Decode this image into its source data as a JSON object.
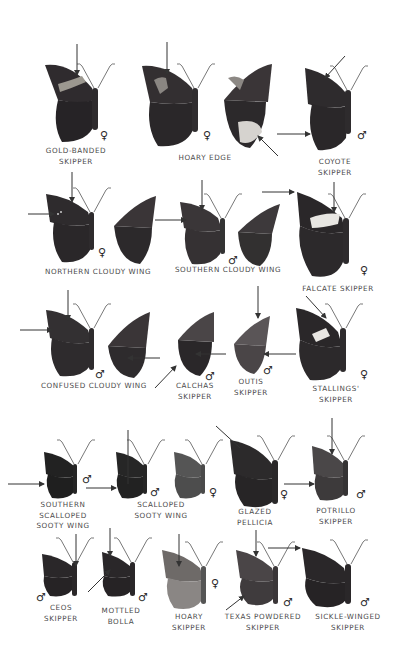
{
  "page": {
    "background": "#ffffff",
    "ink_color": "#4a4a4a",
    "arrow_color": "#333333"
  },
  "symbols": {
    "female": "♀",
    "male": "♂"
  },
  "species": [
    {
      "id": "gold-banded-skipper",
      "label": "GOLD-BANDED\nSKIPPER",
      "sex": "♀",
      "views": [
        "dorsal"
      ],
      "features": [
        "gold band on forewing"
      ]
    },
    {
      "id": "hoary-edge",
      "label": "HOARY EDGE",
      "sex": "♀",
      "views": [
        "dorsal",
        "ventral"
      ],
      "features": [
        "white hindwing margin below"
      ]
    },
    {
      "id": "coyote-skipper",
      "label": "COYOTE\nSKIPPER",
      "sex": "♂",
      "views": [
        "dorsal"
      ]
    },
    {
      "id": "northern-cloudy-wing",
      "label": "NORTHERN CLOUDY WING",
      "sex": "♀",
      "views": [
        "dorsal",
        "ventral"
      ]
    },
    {
      "id": "southern-cloudy-wing",
      "label": "SOUTHERN CLOUDY WING",
      "sex": "♂",
      "views": [
        "dorsal",
        "ventral"
      ]
    },
    {
      "id": "falcate-skipper",
      "label": "FALCATE SKIPPER",
      "sex": "♀",
      "views": [
        "dorsal"
      ]
    },
    {
      "id": "confused-cloudy-wing",
      "label": "CONFUSED CLOUDY WING",
      "sex": "♂",
      "views": [
        "dorsal",
        "ventral"
      ]
    },
    {
      "id": "calchas-skipper",
      "label": "CALCHAS\nSKIPPER",
      "sex": "♂",
      "views": [
        "ventral"
      ]
    },
    {
      "id": "outis-skipper",
      "label": "OUTIS\nSKIPPER",
      "sex": "♂",
      "views": [
        "ventral"
      ]
    },
    {
      "id": "stallings-skipper",
      "label": "STALLINGS'\nSKIPPER",
      "sex": "♀",
      "views": [
        "dorsal"
      ]
    },
    {
      "id": "southern-scalloped-sooty-wing",
      "label": "SOUTHERN\nSCALLOPED\nSOOTY WING",
      "sex": "♂",
      "views": [
        "dorsal"
      ]
    },
    {
      "id": "scalloped-sooty-wing",
      "label": "SCALLOPED\nSOOTY WING",
      "sexes": [
        "♂",
        "♀"
      ],
      "views": [
        "dorsal",
        "dorsal"
      ]
    },
    {
      "id": "glazed-pellicia",
      "label": "GLAZED\nPELLICIA",
      "sex": "♀",
      "views": [
        "dorsal"
      ]
    },
    {
      "id": "potrillo-skipper",
      "label": "POTRILLO\nSKIPPER",
      "sex": "♂",
      "views": [
        "dorsal"
      ]
    },
    {
      "id": "ceos-skipper",
      "label": "CEOS\nSKIPPER",
      "sex": "♂",
      "views": [
        "dorsal"
      ]
    },
    {
      "id": "mottled-bolla",
      "label": "MOTTLED\nBOLLA",
      "sex": "♂",
      "views": [
        "dorsal"
      ]
    },
    {
      "id": "hoary-skipper",
      "label": "HOARY\nSKIPPER",
      "sex": "♀",
      "views": [
        "dorsal"
      ]
    },
    {
      "id": "texas-powdered-skipper",
      "label": "TEXAS POWDERED\nSKIPPER",
      "sex": "♂",
      "views": [
        "dorsal"
      ]
    },
    {
      "id": "sickle-winged-skipper",
      "label": "SICKLE-WINGED\nSKIPPER",
      "sex": "♂",
      "views": [
        "dorsal"
      ]
    }
  ],
  "labels": {
    "gold_banded": "GOLD-BANDED\nSKIPPER",
    "hoary_edge": "HOARY EDGE",
    "coyote": "COYOTE\nSKIPPER",
    "northern_cloudy": "NORTHERN CLOUDY WING",
    "southern_cloudy": "SOUTHERN CLOUDY WING",
    "falcate": "FALCATE SKIPPER",
    "confused_cloudy": "CONFUSED CLOUDY WING",
    "calchas": "CALCHAS\nSKIPPER",
    "outis": "OUTIS\nSKIPPER",
    "stallings": "STALLINGS'\nSKIPPER",
    "southern_scalloped": "SOUTHERN\nSCALLOPED\nSOOTY WING",
    "scalloped": "SCALLOPED\nSOOTY WING",
    "glazed": "GLAZED\nPELLICIA",
    "potrillo": "POTRILLO\nSKIPPER",
    "ceos": "CEOS\nSKIPPER",
    "mottled": "MOTTLED\nBOLLA",
    "hoary_skipper": "HOARY\nSKIPPER",
    "texas_powdered": "TEXAS POWDERED\nSKIPPER",
    "sickle_winged": "SICKLE-WINGED\nSKIPPER"
  },
  "sex_marks": {
    "gold_banded": "♀",
    "hoary_edge": "♀",
    "coyote": "♂",
    "northern_cloudy": "♀",
    "southern_cloudy": "♂",
    "falcate": "♀",
    "confused_cloudy": "♂",
    "calchas": "♂",
    "outis": "♂",
    "stallings": "♀",
    "southern_scalloped": "♂",
    "scalloped_male": "♂",
    "scalloped_female": "♀",
    "glazed": "♀",
    "potrillo": "♂",
    "ceos": "♂",
    "mottled": "♂",
    "hoary_skipper": "♀",
    "texas_powdered": "♂",
    "sickle_winged": "♂"
  }
}
